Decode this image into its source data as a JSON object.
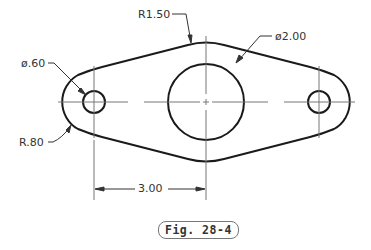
{
  "drawing": {
    "stroke_color": "#1a1a1a",
    "thin_color": "#555555",
    "units": "inches",
    "features": [
      {
        "type": "hole",
        "name": "left-hole",
        "diameter": ".60"
      },
      {
        "type": "hole",
        "name": "center-bore",
        "diameter": "2.00"
      },
      {
        "type": "hole",
        "name": "right-hole",
        "diameter": ".60"
      },
      {
        "type": "arc",
        "name": "end-radius",
        "radius": ".80"
      },
      {
        "type": "arc",
        "name": "center-radius",
        "radius": "1.50"
      }
    ]
  },
  "labels": {
    "r150": "R1.50",
    "d200": "ø2.00",
    "d060": "ø.60",
    "r080": "R.80",
    "dim300": "3.00"
  },
  "caption": "Fig. 28-4"
}
